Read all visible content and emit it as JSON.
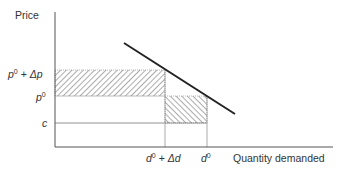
{
  "diagram": {
    "y_axis_label": "Price",
    "x_axis_label": "Quantity demanded",
    "y_ticks": {
      "p0_plus_dp": {
        "base": "p",
        "sup": "0",
        "op": " + ",
        "delta": "Δp"
      },
      "p0": {
        "base": "p",
        "sup": "0"
      },
      "c": {
        "base": "c"
      }
    },
    "x_ticks": {
      "d0_plus_dd": {
        "base": "d",
        "sup": "0",
        "op": " + ",
        "delta": "Δd"
      },
      "d0": {
        "base": "d",
        "sup": "0"
      }
    },
    "elements": [
      {
        "id": "demand-curve",
        "type": "line",
        "description": "downward-sloping demand line"
      },
      {
        "id": "price-gain-area",
        "type": "hatched-rect",
        "hatch": "forward",
        "range_x": [
          "0",
          "d0 + Δd"
        ],
        "range_y": [
          "p0",
          "p0 + Δp"
        ]
      },
      {
        "id": "quantity-loss-area",
        "type": "hatched-rect",
        "hatch": "backward",
        "range_x": [
          "d0 + Δd",
          "d0"
        ],
        "range_y": [
          "c",
          "p0"
        ]
      },
      {
        "id": "cost-line",
        "type": "horizontal-line",
        "level": "c"
      }
    ],
    "colors": {
      "axis": "#555555",
      "curve": "#222222",
      "hatch": "#666666",
      "text": "#333333"
    }
  }
}
